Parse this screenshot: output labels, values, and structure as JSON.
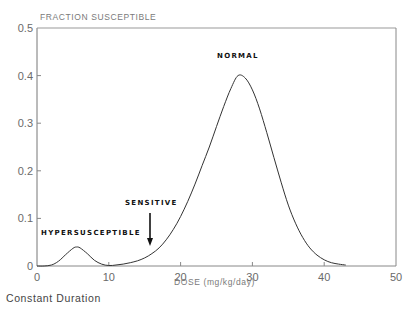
{
  "chart_data": {
    "type": "line",
    "title": "",
    "ylabel": "FRACTION SUSCEPTIBLE",
    "xlabel": "DOSE (mg/kg/day)",
    "xlim": [
      0,
      50
    ],
    "ylim": [
      0,
      0.5
    ],
    "xticks": [
      0,
      10,
      20,
      30,
      40,
      50
    ],
    "xtick_labels": [
      "0",
      "10",
      "20",
      "30",
      "40",
      "50"
    ],
    "yticks": [
      0,
      0.1,
      0.2,
      0.3,
      0.4,
      0.5
    ],
    "ytick_labels": [
      "0",
      "0.1",
      "0.2",
      "0.3",
      "0.4",
      "0.5"
    ],
    "grid": false,
    "legend": null,
    "series": [
      {
        "name": "Fraction susceptible",
        "x": [
          0,
          1,
          2,
          3,
          4,
          5,
          5.5,
          6,
          7,
          8,
          9,
          10,
          11,
          12,
          13,
          14,
          15,
          16,
          17,
          18,
          19,
          20,
          21,
          22,
          23,
          24,
          25,
          26,
          27,
          28,
          29,
          30,
          31,
          32,
          33,
          34,
          35,
          36,
          37,
          38,
          39,
          40,
          41,
          42,
          43
        ],
        "y": [
          0,
          0,
          0.002,
          0.01,
          0.024,
          0.037,
          0.04,
          0.038,
          0.026,
          0.012,
          0.004,
          0.001,
          0.002,
          0.004,
          0.007,
          0.011,
          0.017,
          0.026,
          0.038,
          0.055,
          0.077,
          0.104,
          0.136,
          0.172,
          0.211,
          0.25,
          0.293,
          0.335,
          0.373,
          0.4,
          0.395,
          0.37,
          0.33,
          0.28,
          0.228,
          0.176,
          0.128,
          0.09,
          0.06,
          0.038,
          0.023,
          0.013,
          0.007,
          0.004,
          0.002
        ]
      }
    ],
    "annotations": [
      {
        "text": "NORMAL",
        "x": 28,
        "y": 0.44
      },
      {
        "text": "SENSITIVE",
        "x": 15.5,
        "y": 0.135,
        "arrow_from": [
          15.7,
          0.11
        ],
        "arrow_to": [
          15.7,
          0.045
        ]
      },
      {
        "text": "HYPERSUSCEPTIBLE",
        "x": 6,
        "y": 0.07
      }
    ],
    "caption": "Constant Duration"
  },
  "labels": {
    "ylabel": "FRACTION SUSCEPTIBLE",
    "xlabel": "DOSE (mg/kg/day)",
    "normal": "NORMAL",
    "sensitive": "SENSITIVE",
    "hypersusceptible": "HYPERSUSCEPTIBLE",
    "caption": "Constant Duration"
  }
}
